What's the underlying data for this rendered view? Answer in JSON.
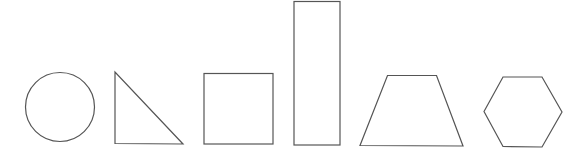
{
  "canvas": {
    "background": "#ffffff",
    "stroke_color": "#555555"
  },
  "shapes": [
    {
      "id": "circle",
      "label": "circle"
    },
    {
      "id": "right-triangle",
      "label": "right triangle"
    },
    {
      "id": "square",
      "label": "square"
    },
    {
      "id": "rectangle",
      "label": "tall rectangle"
    },
    {
      "id": "trapezoid",
      "label": "trapezoid"
    },
    {
      "id": "hexagon",
      "label": "hexagon"
    }
  ]
}
